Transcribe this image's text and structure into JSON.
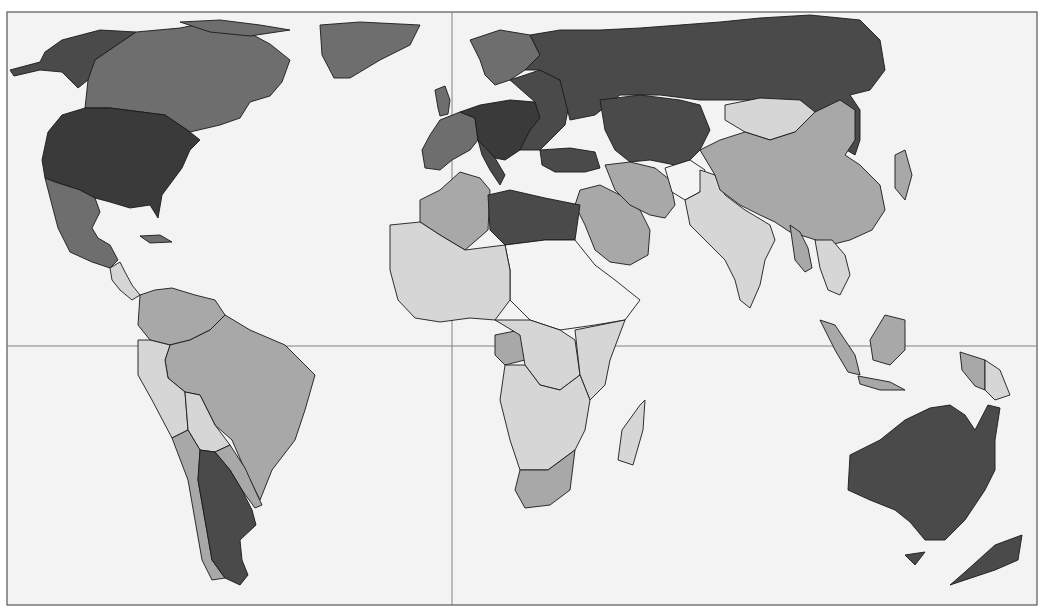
{
  "map": {
    "type": "choropleth",
    "projection": "world, equator and prime meridian lines shown",
    "colors": {
      "background": "#f3f3f3",
      "level_0": "#f4f4f4",
      "level_1": "#d6d6d6",
      "level_2": "#a8a8a8",
      "level_3": "#6e6e6e",
      "level_4": "#4a4a4a",
      "level_5": "#3a3a3a"
    },
    "grid_lines": [
      "equator",
      "prime-meridian"
    ],
    "regions": [
      {
        "name": "alaska",
        "level": 4
      },
      {
        "name": "canada",
        "level": 3
      },
      {
        "name": "greenland",
        "level": 3
      },
      {
        "name": "usa",
        "level": 5
      },
      {
        "name": "mexico",
        "level": 3
      },
      {
        "name": "central-america",
        "level": 1
      },
      {
        "name": "cuba",
        "level": 3
      },
      {
        "name": "colombia-venezuela",
        "level": 2
      },
      {
        "name": "brazil",
        "level": 2
      },
      {
        "name": "peru-ecuador",
        "level": 1
      },
      {
        "name": "bolivia",
        "level": 1
      },
      {
        "name": "paraguay-uruguay",
        "level": 2
      },
      {
        "name": "chile",
        "level": 2
      },
      {
        "name": "argentina",
        "level": 4
      },
      {
        "name": "iceland-uk-scandinavia",
        "level": 3
      },
      {
        "name": "western-europe",
        "level": 3
      },
      {
        "name": "central-europe",
        "level": 5
      },
      {
        "name": "eastern-europe",
        "level": 4
      },
      {
        "name": "russia",
        "level": 4
      },
      {
        "name": "central-asia",
        "level": 4
      },
      {
        "name": "turkey",
        "level": 4
      },
      {
        "name": "north-africa-west",
        "level": 2
      },
      {
        "name": "libya-egypt",
        "level": 4
      },
      {
        "name": "sahel",
        "level": 0
      },
      {
        "name": "west-africa",
        "level": 1
      },
      {
        "name": "central-africa",
        "level": 1
      },
      {
        "name": "congo",
        "level": 2
      },
      {
        "name": "east-africa",
        "level": 1
      },
      {
        "name": "southern-africa",
        "level": 1
      },
      {
        "name": "south-africa",
        "level": 2
      },
      {
        "name": "madagascar",
        "level": 1
      },
      {
        "name": "arabia",
        "level": 2
      },
      {
        "name": "iran",
        "level": 2
      },
      {
        "name": "afghanistan",
        "level": 0
      },
      {
        "name": "pakistan-india",
        "level": 1
      },
      {
        "name": "mongolia",
        "level": 1
      },
      {
        "name": "china",
        "level": 2
      },
      {
        "name": "southeast-asia",
        "level": 1
      },
      {
        "name": "myanmar",
        "level": 2
      },
      {
        "name": "japan-korea",
        "level": 2
      },
      {
        "name": "indonesia",
        "level": 2
      },
      {
        "name": "papua-new-guinea",
        "level": 1
      },
      {
        "name": "australia",
        "level": 4
      },
      {
        "name": "new-zealand",
        "level": 4
      }
    ]
  }
}
